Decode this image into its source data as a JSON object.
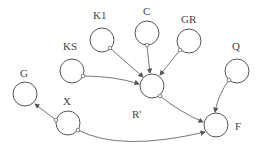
{
  "diagram": {
    "type": "causal-loop / influence diagram",
    "nodes": [
      {
        "id": "K1",
        "label": "K1",
        "cx": 102,
        "cy": 40
      },
      {
        "id": "C",
        "label": "C",
        "cx": 147,
        "cy": 33
      },
      {
        "id": "GR",
        "label": "GR",
        "cx": 189,
        "cy": 41
      },
      {
        "id": "KS",
        "label": "KS",
        "cx": 72,
        "cy": 71
      },
      {
        "id": "Q",
        "label": "Q",
        "cx": 237,
        "cy": 71
      },
      {
        "id": "G",
        "label": "G",
        "cx": 25,
        "cy": 94
      },
      {
        "id": "R'",
        "label": "R'",
        "cx": 152,
        "cy": 86
      },
      {
        "id": "X",
        "label": "X",
        "cx": 68,
        "cy": 123
      },
      {
        "id": "F",
        "label": "F",
        "cx": 216,
        "cy": 125
      }
    ],
    "edges": [
      {
        "from": "K1",
        "to": "R'"
      },
      {
        "from": "C",
        "to": "R'"
      },
      {
        "from": "GR",
        "to": "R'"
      },
      {
        "from": "KS",
        "to": "R'"
      },
      {
        "from": "R'",
        "to": "F"
      },
      {
        "from": "Q",
        "to": "F"
      },
      {
        "from": "X",
        "to": "F"
      },
      {
        "from": "X",
        "to": "G"
      }
    ]
  },
  "labels": {
    "K1": "K1",
    "C": "C",
    "GR": "GR",
    "KS": "KS",
    "Q": "Q",
    "G": "G",
    "R": "R'",
    "X": "X",
    "F": "F"
  }
}
